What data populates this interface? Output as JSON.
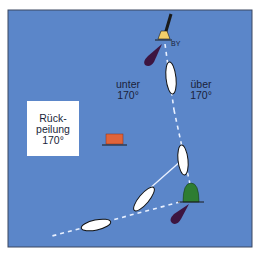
{
  "diagram": {
    "type": "nautical-navigation-diagram",
    "background_color": "#5b86c9",
    "border_color": "#3a4660",
    "labels": {
      "buoy_label": "BY",
      "left_zone_line1": "unter",
      "left_zone_line2": "170°",
      "right_zone_line1": "über",
      "right_zone_line2": "170°",
      "box_line1": "Rück-",
      "box_line2": "peilung",
      "box_line3": "170°"
    },
    "elements": {
      "cardinal_buoy": {
        "name": "north-cardinal-buoy",
        "colors": [
          "#1a1a1a",
          "#f2cf6a"
        ]
      },
      "green_buoy": {
        "name": "green-starboard-buoy",
        "color": "#2e7d32"
      },
      "red_marker": {
        "name": "red-shore-marker",
        "color": "#e0643a"
      },
      "light_sectors": [
        {
          "name": "light-sector-upper",
          "color": "#3d1540"
        },
        {
          "name": "light-sector-lower",
          "color": "#3d1540"
        }
      ],
      "boats": [
        {
          "name": "boat-1",
          "position": "upper"
        },
        {
          "name": "boat-2",
          "position": "middle"
        },
        {
          "name": "boat-3",
          "position": "lower-middle"
        },
        {
          "name": "boat-4",
          "position": "lower-left"
        }
      ],
      "bearing_line_color": "#e8f0ff"
    }
  }
}
